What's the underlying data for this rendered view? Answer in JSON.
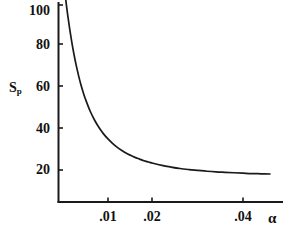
{
  "chart_data": {
    "type": "line",
    "title": "",
    "subtitle": "",
    "xlabel": "α",
    "ylabel": "Sp",
    "ylabel_base": "S",
    "ylabel_sub": "p",
    "grid": false,
    "legend": null,
    "xlim": [
      0.0,
      0.0495
    ],
    "ylim": [
      0,
      108
    ],
    "x_ticks": [
      {
        "value": 0.01,
        "label": ".01"
      },
      {
        "value": 0.02,
        "label": ".02"
      },
      {
        "value": 0.04,
        "label": ".04"
      }
    ],
    "y_ticks": [
      {
        "value": 20,
        "label": "20"
      },
      {
        "value": 40,
        "label": "40"
      },
      {
        "value": 60,
        "label": "60"
      },
      {
        "value": 80,
        "label": "80"
      },
      {
        "value": 100,
        "label": "100"
      }
    ],
    "series": [
      {
        "name": "Sp vs alpha",
        "color": "#1a1a1a",
        "x": [
          0.0005,
          0.001,
          0.0015,
          0.002,
          0.0025,
          0.003,
          0.0035,
          0.004,
          0.0045,
          0.005,
          0.006,
          0.007,
          0.008,
          0.009,
          0.01,
          0.011,
          0.012,
          0.013,
          0.014,
          0.015,
          0.016,
          0.017,
          0.018,
          0.019,
          0.02,
          0.022,
          0.024,
          0.026,
          0.028,
          0.03,
          0.032,
          0.034,
          0.036,
          0.038,
          0.04,
          0.042,
          0.044,
          0.046
        ],
        "y": [
          103.0,
          94.5,
          87.0,
          80.3,
          74.4,
          69.2,
          64.6,
          60.5,
          56.9,
          53.7,
          48.2,
          43.8,
          40.2,
          37.2,
          34.8,
          32.7,
          30.9,
          29.4,
          28.1,
          27.0,
          26.0,
          25.2,
          24.4,
          23.8,
          23.2,
          22.2,
          21.4,
          20.7,
          20.2,
          19.8,
          19.4,
          19.1,
          18.9,
          18.7,
          18.5,
          18.3,
          18.2,
          18.1
        ]
      }
    ],
    "notes": {
      "curve_shape": "monotonic decreasing exponential-like decay",
      "peak_value": 103,
      "asymptote_value": 18
    }
  },
  "axes": {
    "y_axis_name": "y-axis-line",
    "x_axis_name": "x-axis-line",
    "line_color": "#1a1a1a"
  }
}
